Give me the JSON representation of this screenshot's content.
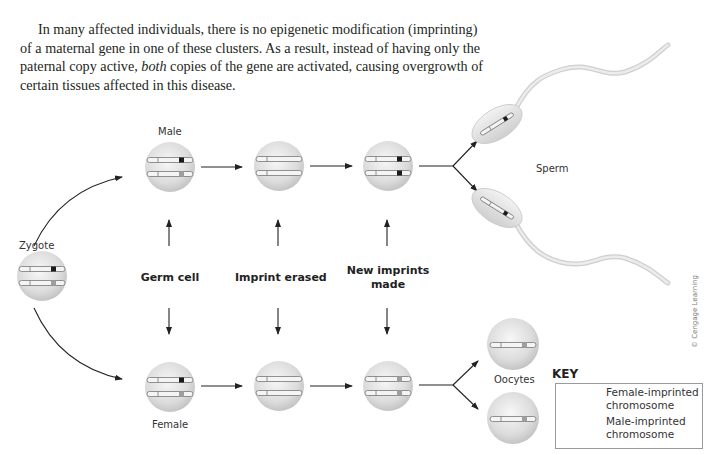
{
  "paragraph": {
    "part1": "In many affected individuals, there is no epigenetic modification (imprinting) of a maternal gene in one of these clusters. As a result, instead of having only the paternal copy active, ",
    "emphasis": "both",
    "part2": " copies of the gene are activated, causing overgrowth of certain tissues affected in this disease."
  },
  "figure": {
    "labels": {
      "zygote": "Zygote",
      "male": "Male",
      "female": "Female",
      "sperm": "Sperm",
      "oocytes": "Oocytes"
    },
    "stages": [
      {
        "label": "Germ cell"
      },
      {
        "label": "Imprint erased"
      },
      {
        "label_line1": "New imprints",
        "label_line2": "made"
      }
    ],
    "key": {
      "title": "KEY",
      "items": [
        {
          "line1": "Female-imprinted",
          "line2": "chromosome",
          "mark_color": "#9e9e9e"
        },
        {
          "line1": "Male-imprinted",
          "line2": "chromosome",
          "mark_color": "#1a1a1a"
        }
      ]
    },
    "credit": "© Cengage Learning",
    "colors": {
      "text": "#231f20",
      "cell_fill": "#d9d9d9",
      "male_mark": "#1a1a1a",
      "female_mark": "#9e9e9e",
      "arrow": "#222222"
    }
  }
}
